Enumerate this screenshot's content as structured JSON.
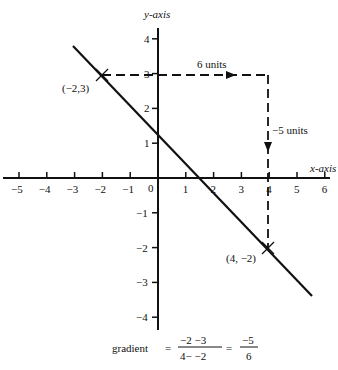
{
  "chart_data": {
    "type": "line",
    "title": "",
    "xlabel": "x-axis",
    "ylabel": "y-axis",
    "xlim": [
      -5,
      6
    ],
    "ylim": [
      -4,
      4
    ],
    "grid": false,
    "x_ticks": [
      -5,
      -4,
      -3,
      -2,
      -1,
      0,
      1,
      2,
      3,
      4,
      5,
      6
    ],
    "x_tick_labels": [
      "−5",
      "−4",
      "−3",
      "−2",
      "−1",
      "0",
      "1",
      "2",
      "3",
      "4",
      "5",
      "6"
    ],
    "y_ticks": [
      4,
      3,
      2,
      1,
      -1,
      -2,
      -3,
      -4
    ],
    "y_tick_labels": [
      "4",
      "3",
      "2",
      "1",
      "−1",
      "−2",
      "−3",
      "−4"
    ],
    "series": [
      {
        "name": "line",
        "x": [
          -3,
          6.5
        ],
        "y": [
          3.83,
          -4.08
        ]
      }
    ],
    "points": [
      {
        "label": "(−2,3)",
        "x": -2,
        "y": 3
      },
      {
        "label": "(4, −2)",
        "x": 4,
        "y": -2
      }
    ],
    "annotations": [
      {
        "text": "6 units",
        "type": "horizontal-run",
        "from": [
          -2,
          3
        ],
        "to": [
          4,
          3
        ]
      },
      {
        "text": "−5 units",
        "type": "vertical-rise",
        "from": [
          4,
          3
        ],
        "to": [
          4,
          -2
        ]
      }
    ],
    "formula": {
      "prefix": "gradient",
      "num1": "−2 −3",
      "den1": "4− −2",
      "num2": "−5",
      "den2": "6"
    }
  },
  "labels": {
    "run": "6 units",
    "rise": "−5 units",
    "p1": "(−2,3)",
    "p2": "(4, −2)",
    "xaxis": "x-axis",
    "yaxis": "y-axis",
    "gradient": "gradient",
    "eq": "=",
    "num1": "−2 −3",
    "den1": "4− −2",
    "num2": "−5",
    "den2": "6",
    "origin": "0"
  }
}
